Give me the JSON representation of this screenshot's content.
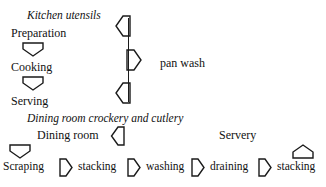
{
  "diagram": {
    "background_color": "#ffffff",
    "stroke_color": "#1a1a1a",
    "text_color": "#111111",
    "sections": [
      {
        "id": "kitchen",
        "heading": "Kitchen utensils",
        "steps": [
          {
            "label": "Preparation"
          },
          {
            "label": "Cooking"
          },
          {
            "label": "Serving"
          }
        ],
        "connectors": [
          {
            "direction": "down",
            "from": "Preparation",
            "to": "Cooking"
          },
          {
            "direction": "down",
            "from": "Cooking",
            "to": "Serving"
          }
        ],
        "side_process": {
          "label": "pan wash",
          "connectors": [
            {
              "direction": "left",
              "at": "Preparation"
            },
            {
              "direction": "right",
              "at": "Cooking"
            },
            {
              "direction": "left",
              "at": "Serving"
            }
          ]
        }
      },
      {
        "id": "dining",
        "heading": "Dining room crockery and cutlery",
        "area_labels": [
          {
            "label": "Dining room"
          },
          {
            "label": "Servery"
          }
        ],
        "steps": [
          {
            "label": "Scraping"
          },
          {
            "label": "stacking"
          },
          {
            "label": "washing"
          },
          {
            "label": "draining"
          },
          {
            "label": "stacking"
          }
        ],
        "connectors": [
          {
            "direction": "left",
            "after": "Dining room"
          },
          {
            "direction": "down",
            "above": "Scraping"
          },
          {
            "direction": "right",
            "from": "Scraping",
            "to": "stacking"
          },
          {
            "direction": "right",
            "from": "stacking",
            "to": "washing"
          },
          {
            "direction": "right",
            "from": "washing",
            "to": "draining"
          },
          {
            "direction": "right",
            "from": "draining",
            "to": "stacking"
          },
          {
            "direction": "up",
            "above": "stacking"
          }
        ]
      }
    ]
  }
}
